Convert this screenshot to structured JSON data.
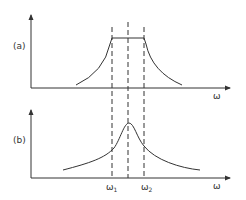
{
  "panels": [
    {
      "id": "a",
      "label": "(a)",
      "description": "Ideal band-pass response: flat top between ω1 and ω2 with decaying skirts"
    },
    {
      "id": "b",
      "label": "(b)",
      "description": "Resonance curve peaked between ω1 and ω2"
    }
  ],
  "axis": {
    "x_label": "ω"
  },
  "markers": {
    "omega1": {
      "symbol": "ω",
      "subscript": "1"
    },
    "omega2": {
      "symbol": "ω",
      "subscript": "2"
    }
  },
  "colors": {
    "line": "#333333",
    "background": "#ffffff"
  }
}
